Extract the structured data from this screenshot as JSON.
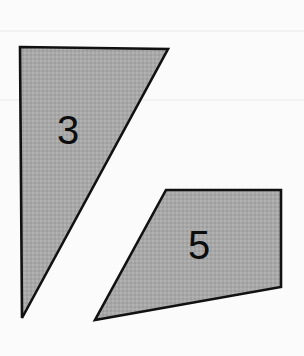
{
  "canvas": {
    "width": 304,
    "height": 356,
    "background_color": "#fbfbfb",
    "page_color": "#ffffff"
  },
  "style": {
    "fill_color": "#a8a8a8",
    "stroke_color": "#111111",
    "stroke_width": 2.6,
    "label_color": "#0d0d0d",
    "label_font_size": 40,
    "scanline_color": "#f2f2f2"
  },
  "figure": {
    "type": "geometry-shape-diagram",
    "shape_count": 2,
    "shapes": [
      {
        "name": "triangle",
        "label": "3",
        "sides": 3,
        "points": "20,47 168,49 22,318",
        "vertices": [
          {
            "x": 20,
            "y": 47
          },
          {
            "x": 168,
            "y": 49
          },
          {
            "x": 22,
            "y": 318
          }
        ],
        "label_position": {
          "x": 68,
          "y": 133
        },
        "fill_color": "#a8a8a8",
        "stroke_color": "#111111"
      },
      {
        "name": "quadrilateral",
        "label": "5",
        "sides": 4,
        "points": "166,190 281,190 281,287 95,320",
        "vertices": [
          {
            "x": 166,
            "y": 190
          },
          {
            "x": 281,
            "y": 190
          },
          {
            "x": 281,
            "y": 287
          },
          {
            "x": 95,
            "y": 320
          }
        ],
        "label_position": {
          "x": 199,
          "y": 248
        },
        "fill_color": "#a8a8a8",
        "stroke_color": "#111111"
      }
    ],
    "scanlines": [
      {
        "name": "upper-scanline",
        "y": 30,
        "height": 2,
        "color": "#f1f1f1"
      },
      {
        "name": "lower-scanline",
        "y": 99,
        "height": 2,
        "color": "#f3f3f3"
      }
    ]
  }
}
